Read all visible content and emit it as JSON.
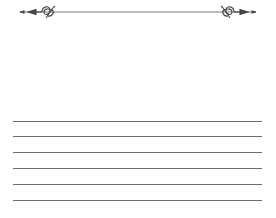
{
  "page": {
    "type": "lined-writing-paper",
    "background_color": "#ffffff",
    "line_color": "#6e6e6e"
  },
  "header": {
    "divider": {
      "icon": "flourish-divider-icon",
      "color": "#555555"
    },
    "title_area_text": ""
  },
  "ruled_lines": {
    "count": 6,
    "positions_y": [
      121,
      136,
      152,
      168,
      184,
      200
    ]
  }
}
